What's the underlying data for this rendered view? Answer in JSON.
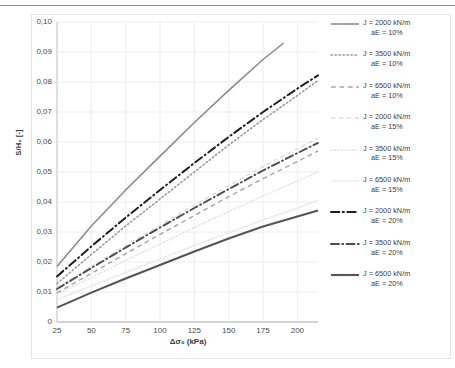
{
  "chart_data": {
    "type": "line",
    "title": "",
    "xlabel": "Δσ₀ (kPa)",
    "ylabel": "S/H₀ [-]",
    "xlim": [
      25,
      215
    ],
    "ylim": [
      0,
      0.1
    ],
    "xticks": [
      25,
      50,
      75,
      100,
      125,
      150,
      175,
      200
    ],
    "xtick_labels": [
      "25",
      "50",
      "75",
      "100",
      "125",
      "150",
      "175",
      "200"
    ],
    "yticks": [
      0,
      0.01,
      0.02,
      0.03,
      0.04,
      0.05,
      0.06,
      0.07,
      0.08,
      0.09,
      0.1
    ],
    "ytick_labels": [
      "0",
      "0,01",
      "0,02",
      "0,03",
      "0,04",
      "0,05",
      "0,06",
      "0,07",
      "0,08",
      "0,09",
      "0,10"
    ],
    "grid": true,
    "legend_position": "right",
    "series": [
      {
        "name": "J = 2000 kN/m aE = 10%",
        "label_line1": "J = 2000 kN/m",
        "label_line2": "aE = 10%",
        "style": "solid",
        "color": "#8c8c8c",
        "width": 1.6,
        "x": [
          25,
          50,
          75,
          100,
          125,
          150,
          175,
          190
        ],
        "y": [
          0.0185,
          0.032,
          0.044,
          0.0553,
          0.0665,
          0.0772,
          0.0875,
          0.093
        ]
      },
      {
        "name": "J = 3500 kN/m aE = 10%",
        "label_line1": "J = 3500 kN/m",
        "label_line2": "aE = 10%",
        "style": "dotted",
        "color": "#9a9a9a",
        "width": 1.6,
        "x": [
          25,
          50,
          75,
          100,
          125,
          150,
          175,
          200,
          215
        ],
        "y": [
          0.0128,
          0.0225,
          0.032,
          0.041,
          0.05,
          0.059,
          0.0675,
          0.0755,
          0.0805
        ]
      },
      {
        "name": "J = 6500 kN/m aE = 10%",
        "label_line1": "J = 6500 kN/m",
        "label_line2": "aE = 10%",
        "style": "dashed",
        "color": "#a8a8a8",
        "width": 1.5,
        "x": [
          25,
          50,
          75,
          100,
          125,
          150,
          175,
          200,
          215
        ],
        "y": [
          0.0097,
          0.0162,
          0.0228,
          0.0292,
          0.0355,
          0.0418,
          0.0478,
          0.0535,
          0.057
        ]
      },
      {
        "name": "J = 2000 kN/m aE = 15%",
        "label_line1": "J = 2000 kN/m",
        "label_line2": "aE = 15%",
        "style": "dashed-light",
        "color": "#dcdcdc",
        "width": 1.4,
        "x": [
          25,
          50,
          75,
          100,
          125,
          150,
          175,
          200,
          215
        ],
        "y": [
          0.0115,
          0.0185,
          0.0255,
          0.0323,
          0.039,
          0.0455,
          0.0518,
          0.0578,
          0.0612
        ]
      },
      {
        "name": "J = 3500 kN/m aE = 15%",
        "label_line1": "J = 3500 kN/m",
        "label_line2": "aE = 15%",
        "style": "dotted-light",
        "color": "#e2e2e2",
        "width": 1.4,
        "x": [
          25,
          50,
          75,
          100,
          125,
          150,
          175,
          200,
          215
        ],
        "y": [
          0.0092,
          0.0148,
          0.0205,
          0.026,
          0.0315,
          0.0368,
          0.042,
          0.047,
          0.05
        ]
      },
      {
        "name": "J = 6500 kN/m aE = 15%",
        "label_line1": "J = 6500 kN/m",
        "label_line2": "aE = 15%",
        "style": "solid-light",
        "color": "#ebebeb",
        "width": 1.4,
        "x": [
          25,
          50,
          75,
          100,
          125,
          150,
          175,
          200,
          215
        ],
        "y": [
          0.0075,
          0.012,
          0.0165,
          0.021,
          0.0255,
          0.0298,
          0.034,
          0.038,
          0.0405
        ]
      },
      {
        "name": "J = 2000 kN/m aE = 20%",
        "label_line1": "J = 2000 kN/m",
        "label_line2": "aE = 20%",
        "style": "dashdot",
        "color": "#1f1f1f",
        "width": 2.0,
        "x": [
          25,
          50,
          75,
          100,
          125,
          150,
          175,
          200,
          215
        ],
        "y": [
          0.0152,
          0.0252,
          0.0348,
          0.044,
          0.053,
          0.0617,
          0.07,
          0.0778,
          0.0822
        ]
      },
      {
        "name": "J = 3500 kN/m aE = 20%",
        "label_line1": "J = 3500 kN/m",
        "label_line2": "aE = 20%",
        "style": "dashdot",
        "color": "#4d4d4d",
        "width": 1.9,
        "x": [
          25,
          50,
          75,
          100,
          125,
          150,
          175,
          200,
          215
        ],
        "y": [
          0.011,
          0.018,
          0.0248,
          0.0315,
          0.038,
          0.0443,
          0.0505,
          0.0563,
          0.0597
        ]
      },
      {
        "name": "J = 6500 kN/m aE = 20%",
        "label_line1": "J = 6500 kN/m",
        "label_line2": "aE = 20%",
        "style": "solid",
        "color": "#555555",
        "width": 2.1,
        "x": [
          25,
          50,
          75,
          100,
          125,
          150,
          175,
          200,
          215
        ],
        "y": [
          0.0048,
          0.0098,
          0.0145,
          0.019,
          0.0235,
          0.0278,
          0.0318,
          0.0352,
          0.0372
        ]
      }
    ]
  }
}
